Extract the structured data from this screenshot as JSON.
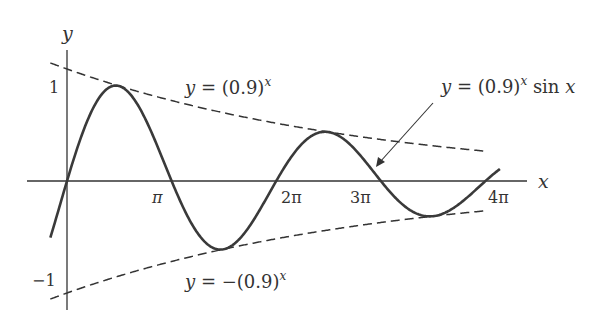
{
  "chart_data": {
    "type": "line",
    "title": "",
    "xlabel": "x",
    "ylabel": "y",
    "xlim": [
      -0.3,
      13.0
    ],
    "ylim": [
      -1.2,
      1.15
    ],
    "grid": false,
    "legend_position": "none",
    "x_ticks": [
      {
        "value": 3.14159,
        "label": "π"
      },
      {
        "value": 6.28319,
        "label": "2π"
      },
      {
        "value": 9.42478,
        "label": "3π"
      },
      {
        "value": 12.56637,
        "label": "4π"
      }
    ],
    "y_ticks": [
      {
        "value": 1,
        "label": "1"
      },
      {
        "value": -1,
        "label": "−1"
      }
    ],
    "series": [
      {
        "name": "y = (0.9)^x sin x",
        "style": "solid",
        "function": "0.9^x * sin(x)",
        "x_range": [
          -0.5,
          13.0
        ],
        "x": [
          0,
          1.571,
          3.1416,
          4.712,
          6.2832,
          7.854,
          9.4248,
          10.996,
          12.566
        ],
        "values": [
          0,
          0.847,
          0,
          -0.609,
          0,
          0.437,
          0,
          -0.314,
          0
        ]
      },
      {
        "name": "y = (0.9)^x",
        "style": "dashed",
        "function": "0.9^x",
        "x_range": [
          -0.5,
          12.6
        ],
        "x": [
          0,
          3.1416,
          6.2832,
          9.4248,
          12.566
        ],
        "values": [
          1,
          0.718,
          0.516,
          0.371,
          0.266
        ]
      },
      {
        "name": "y = −(0.9)^x",
        "style": "dashed",
        "function": "-0.9^x",
        "x_range": [
          -0.5,
          12.6
        ],
        "x": [
          0,
          3.1416,
          6.2832,
          9.4248,
          12.566
        ],
        "values": [
          -1,
          -0.718,
          -0.516,
          -0.371,
          -0.266
        ]
      }
    ],
    "annotations": [
      {
        "text": "y = (0.9)^x",
        "target": "upper envelope"
      },
      {
        "text": "y = −(0.9)^x",
        "target": "lower envelope"
      },
      {
        "text": "y = (0.9)^x sin x",
        "target": "damped sine curve",
        "arrow": true
      }
    ]
  },
  "labels": {
    "x_axis": "x",
    "y_axis": "y",
    "tick_pi": "π",
    "tick_2pi": "2π",
    "tick_3pi": "3π",
    "tick_4pi": "4π",
    "tick_one": "1",
    "tick_neg_one": "−1",
    "upper_env_prefix": "y = (0.9)",
    "upper_env_exp": "x",
    "lower_env_prefix": "y = −(0.9)",
    "lower_env_exp": "x",
    "curve_prefix": "y = (0.9)",
    "curve_exp": "x",
    "curve_suffix": " sin x"
  },
  "colors": {
    "curve": "#3a3a3a",
    "axis": "#333333",
    "text": "#333333"
  }
}
